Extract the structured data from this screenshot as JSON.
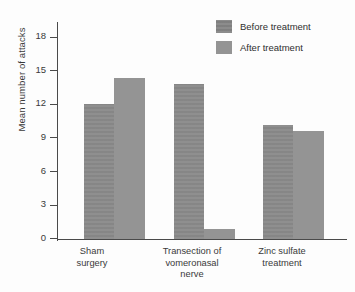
{
  "chart_data": {
    "type": "bar",
    "title": "",
    "xlabel": "",
    "ylabel": "Mean number of attacks",
    "ylim": [
      0,
      19.5
    ],
    "yticks": [
      0,
      3,
      6,
      9,
      12,
      15,
      18
    ],
    "ytick_labels": [
      "0",
      "3",
      "6",
      "9",
      "12",
      "15",
      "18"
    ],
    "grid": false,
    "legend_position": "top-right",
    "categories": [
      "Sham\nsurgery",
      "Transection of\nvomeronasal\nnerve",
      "Zinc sulfate\ntreatment"
    ],
    "category_lines": [
      [
        "Sham",
        "surgery"
      ],
      [
        "Transection of",
        "vomeronasal",
        "nerve"
      ],
      [
        "Zinc sulfate",
        "treatment"
      ]
    ],
    "series": [
      {
        "name": "Before treatment",
        "color": "#8b8b8b",
        "values": [
          12.1,
          13.9,
          10.2
        ]
      },
      {
        "name": "After treatment",
        "color": "#949494",
        "values": [
          14.4,
          0.9,
          9.7
        ]
      }
    ]
  },
  "axis": {
    "ylabel": "Mean number of attacks",
    "tick_0": "0",
    "tick_3": "3",
    "tick_6": "6",
    "tick_9": "9",
    "tick_12": "12",
    "tick_15": "15",
    "tick_18": "18"
  },
  "legend": {
    "before_label": "Before treatment",
    "after_label": "After treatment"
  },
  "categories": {
    "g1_l1": "Sham",
    "g1_l2": "surgery",
    "g2_l1": "Transection of",
    "g2_l2": "vomeronasal",
    "g2_l3": "nerve",
    "g3_l1": "Zinc sulfate",
    "g3_l2": "treatment"
  }
}
